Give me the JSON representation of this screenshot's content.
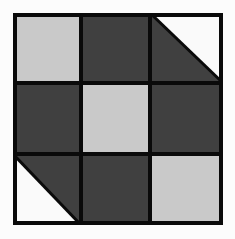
{
  "diagram": {
    "type": "quilt-block-3x3",
    "colors": {
      "light": "#c9c9c9",
      "dark": "#404040",
      "white": "#fafafa",
      "border": "#0a0a0a"
    },
    "cells": [
      {
        "row": 0,
        "col": 0,
        "fill": "light"
      },
      {
        "row": 0,
        "col": 1,
        "fill": "dark"
      },
      {
        "row": 0,
        "col": 2,
        "fill": "half-triangle",
        "upper_right": "white",
        "lower_left": "dark"
      },
      {
        "row": 1,
        "col": 0,
        "fill": "dark"
      },
      {
        "row": 1,
        "col": 1,
        "fill": "light"
      },
      {
        "row": 1,
        "col": 2,
        "fill": "dark"
      },
      {
        "row": 2,
        "col": 0,
        "fill": "half-triangle",
        "upper_right": "dark",
        "lower_left": "white"
      },
      {
        "row": 2,
        "col": 1,
        "fill": "dark"
      },
      {
        "row": 2,
        "col": 2,
        "fill": "light"
      }
    ]
  }
}
